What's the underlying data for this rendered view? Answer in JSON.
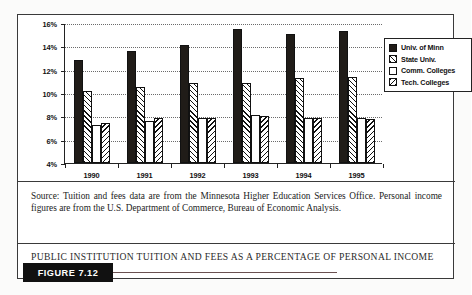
{
  "figure": {
    "badge_label": "FIGURE 7.12",
    "title": "PUBLIC INSTITUTION TUITION AND FEES AS A PERCENTAGE OF PERSONAL INCOME",
    "source_note": "Source: Tuition and fees data are from the Minnesota Higher Education Services Office. Personal income figures are from the U.S. Department of Commerce, Bureau of Economic Analysis."
  },
  "colors": {
    "series_solid": "#201c18",
    "series_empty": "#ffffff",
    "hatch_line": "#111111",
    "frame": "#3a3a3a",
    "badge_background": "#111111",
    "badge_text": "#ffffff"
  },
  "chart_data": {
    "type": "bar",
    "title": "",
    "xlabel": "",
    "ylabel": "",
    "ylim": [
      4,
      16
    ],
    "yticks": [
      4,
      6,
      8,
      10,
      12,
      14,
      16
    ],
    "ytick_labels": [
      "4%",
      "6%",
      "8%",
      "10%",
      "12%",
      "14%",
      "16%"
    ],
    "grid": true,
    "legend_position": "upper-right",
    "categories": [
      "1990",
      "1991",
      "1992",
      "1993",
      "1994",
      "1995"
    ],
    "series": [
      {
        "name": "Univ. of Minn",
        "pattern": "solid",
        "values": [
          12.8,
          13.6,
          14.1,
          15.5,
          15.1,
          15.3
        ]
      },
      {
        "name": "State Univ.",
        "pattern": "forward-diagonal",
        "values": [
          10.2,
          10.5,
          10.9,
          10.9,
          11.3,
          11.4
        ]
      },
      {
        "name": "Comm. Colleges",
        "pattern": "empty",
        "values": [
          7.3,
          7.6,
          7.9,
          8.1,
          7.9,
          7.9
        ]
      },
      {
        "name": "Tech. Colleges",
        "pattern": "backward-diagonal",
        "values": [
          7.4,
          7.9,
          7.9,
          8.0,
          7.85,
          7.8
        ]
      }
    ]
  }
}
